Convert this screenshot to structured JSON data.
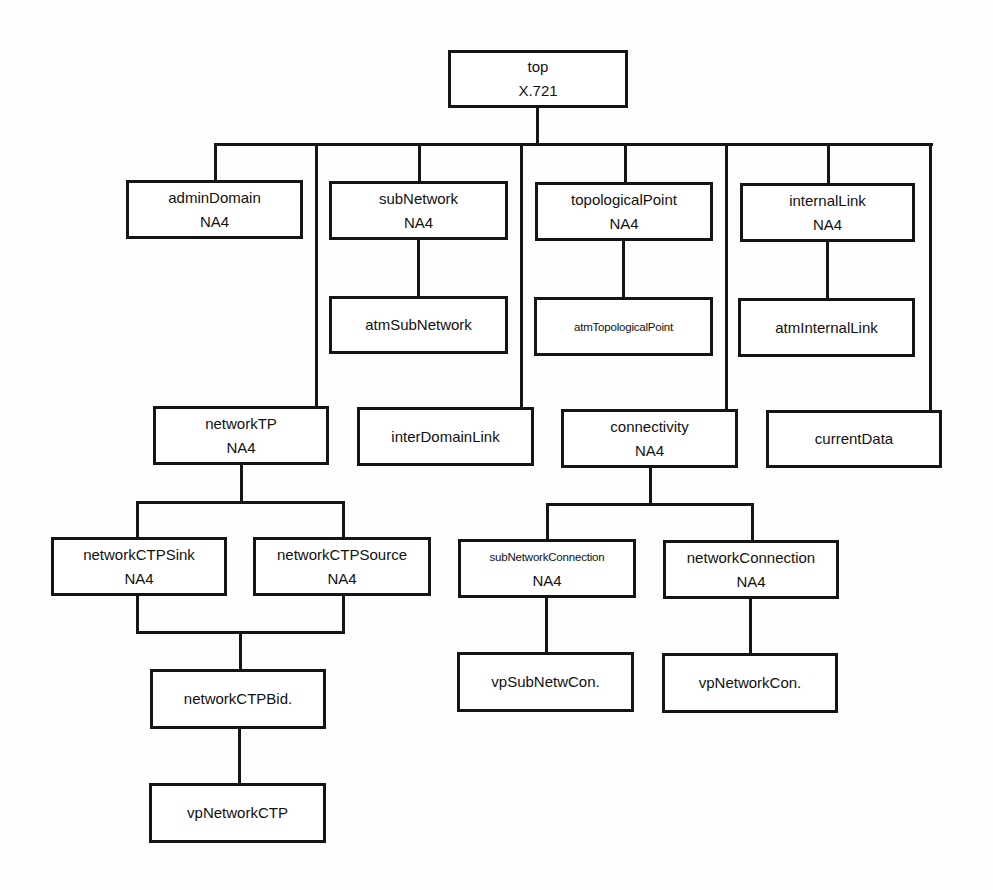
{
  "diagram": {
    "type": "class inheritance tree",
    "nodes": {
      "top": {
        "name": "top",
        "ref": "X.721"
      },
      "adminDomain": {
        "name": "adminDomain",
        "ref": "NA4"
      },
      "subNetwork": {
        "name": "subNetwork",
        "ref": "NA4"
      },
      "atmSubNetwork": {
        "name": "atmSubNetwork"
      },
      "topologicalPoint": {
        "name": "topologicalPoint",
        "ref": "NA4"
      },
      "atmTopologicalPoint": {
        "name": "atmTopologicalPoint"
      },
      "internalLink": {
        "name": "internalLink",
        "ref": "NA4"
      },
      "atmInternalLink": {
        "name": "atmInternalLink"
      },
      "networkTP": {
        "name": "networkTP",
        "ref": "NA4"
      },
      "interDomainLink": {
        "name": "interDomainLink"
      },
      "connectivity": {
        "name": "connectivity",
        "ref": "NA4"
      },
      "currentData": {
        "name": "currentData"
      },
      "networkCTPSink": {
        "name": "networkCTPSink",
        "ref": "NA4"
      },
      "networkCTPSource": {
        "name": "networkCTPSource",
        "ref": "NA4"
      },
      "networkCTPBid": {
        "name": "networkCTPBid."
      },
      "vpNetworkCTP": {
        "name": "vpNetworkCTP"
      },
      "subNetworkConnection": {
        "name": "subNetworkConnection",
        "ref": "NA4"
      },
      "networkConnection": {
        "name": "networkConnection",
        "ref": "NA4"
      },
      "vpSubNetwCon": {
        "name": "vpSubNetwCon."
      },
      "vpNetworkCon": {
        "name": "vpNetworkCon."
      }
    },
    "edges": [
      [
        "top",
        "adminDomain"
      ],
      [
        "top",
        "networkTP"
      ],
      [
        "top",
        "subNetwork"
      ],
      [
        "top",
        "interDomainLink"
      ],
      [
        "top",
        "topologicalPoint"
      ],
      [
        "top",
        "connectivity"
      ],
      [
        "top",
        "internalLink"
      ],
      [
        "top",
        "currentData"
      ],
      [
        "subNetwork",
        "atmSubNetwork"
      ],
      [
        "topologicalPoint",
        "atmTopologicalPoint"
      ],
      [
        "internalLink",
        "atmInternalLink"
      ],
      [
        "networkTP",
        "networkCTPSink"
      ],
      [
        "networkTP",
        "networkCTPSource"
      ],
      [
        "networkCTPSink",
        "networkCTPBid"
      ],
      [
        "networkCTPSource",
        "networkCTPBid"
      ],
      [
        "networkCTPBid",
        "vpNetworkCTP"
      ],
      [
        "connectivity",
        "subNetworkConnection"
      ],
      [
        "connectivity",
        "networkConnection"
      ],
      [
        "subNetworkConnection",
        "vpSubNetwCon"
      ],
      [
        "networkConnection",
        "vpNetworkCon"
      ]
    ]
  }
}
